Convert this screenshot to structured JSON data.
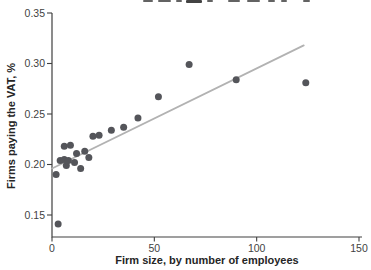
{
  "chart_data": {
    "type": "scatter",
    "title": "",
    "xlabel": "Firm size, by number of employees",
    "ylabel": "Firms paying the VAT, %",
    "xlim": [
      0,
      150
    ],
    "ylim": [
      0.128,
      0.35
    ],
    "x_tick_values": [
      0,
      50,
      100,
      150
    ],
    "x_tick_labels": [
      "0",
      "50",
      "100",
      "150"
    ],
    "y_tick_values": [
      0.15,
      0.2,
      0.25,
      0.3,
      0.35
    ],
    "y_tick_labels": [
      "0.15",
      "0.20",
      "0.25",
      "0.30",
      "0.35"
    ],
    "grid": false,
    "legend": "none",
    "points": [
      [
        3,
        0.141
      ],
      [
        2,
        0.19
      ],
      [
        4,
        0.204
      ],
      [
        7,
        0.199
      ],
      [
        6,
        0.205
      ],
      [
        6,
        0.218
      ],
      [
        9,
        0.219
      ],
      [
        8,
        0.204
      ],
      [
        11,
        0.202
      ],
      [
        12,
        0.211
      ],
      [
        14,
        0.196
      ],
      [
        16,
        0.213
      ],
      [
        18,
        0.207
      ],
      [
        20,
        0.228
      ],
      [
        23,
        0.229
      ],
      [
        29,
        0.234
      ],
      [
        35,
        0.237
      ],
      [
        42,
        0.246
      ],
      [
        52,
        0.267
      ],
      [
        67,
        0.299
      ],
      [
        90,
        0.284
      ],
      [
        124,
        0.281
      ]
    ],
    "trend_line": {
      "x1": 0,
      "y1": 0.196,
      "x2": 123,
      "y2": 0.318
    },
    "colors": {
      "point": "#54555a",
      "trend": "#b2b2b2",
      "axis": "#404040",
      "tick_label": "#3f3f3f",
      "axis_title": "#262626"
    }
  }
}
